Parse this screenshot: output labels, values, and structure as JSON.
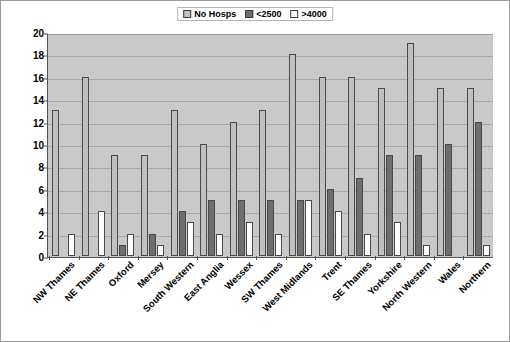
{
  "chart_data": {
    "type": "bar",
    "title": "",
    "subtitle": "",
    "xlabel": "",
    "ylabel": "",
    "ylim": [
      0,
      20
    ],
    "yticks": [
      0,
      2,
      4,
      6,
      8,
      10,
      12,
      14,
      16,
      18,
      20
    ],
    "grid": true,
    "legend_position": "top-center",
    "categories": [
      "NW Thames",
      "NE Thames",
      "Oxford",
      "Mersey",
      "South Western",
      "East Anglia",
      "Wessex",
      "SW Thames",
      "West Midlands",
      "Trent",
      "SE Thames",
      "Yorkshire",
      "North Western",
      "Wales",
      "Northern"
    ],
    "series": [
      {
        "name": "No Hosps",
        "color": "#c0c0c0",
        "values": [
          13,
          16,
          9,
          9,
          13,
          10,
          12,
          13,
          18,
          16,
          16,
          15,
          19,
          15,
          15
        ]
      },
      {
        "name": "<2500",
        "color": "#6e6e6e",
        "values": [
          0,
          0,
          1,
          2,
          4,
          5,
          5,
          5,
          5,
          6,
          7,
          9,
          9,
          10,
          12
        ]
      },
      {
        "name": ">4000",
        "color": "#ffffff",
        "values": [
          2,
          4,
          2,
          1,
          3,
          2,
          3,
          2,
          5,
          4,
          2,
          3,
          1,
          0,
          1
        ]
      }
    ]
  },
  "legend": {
    "entries": [
      {
        "label": "No Hosps",
        "color": "#c0c0c0"
      },
      {
        "label": "<2500",
        "color": "#6e6e6e"
      },
      {
        "label": ">4000",
        "color": "#ffffff"
      }
    ]
  },
  "colors": {
    "plot_background": "#c9c9c9",
    "gridline": "#a8a8a8",
    "axis": "#555555",
    "bar_border": "#4a4a4a",
    "page_background": "#ffffff"
  }
}
